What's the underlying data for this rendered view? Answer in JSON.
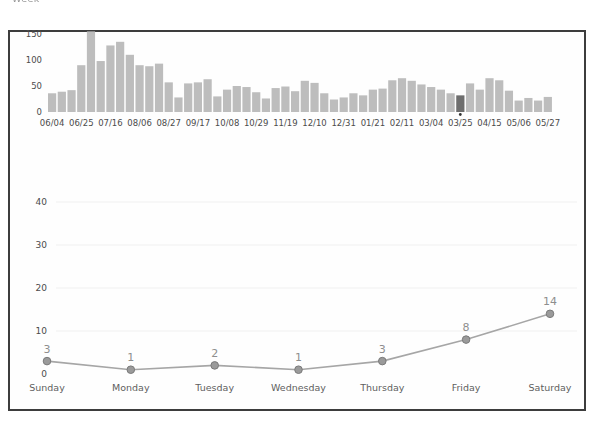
{
  "page": {
    "clipped_top_text": "Week",
    "colors": {
      "frame_border": "#3d3d3d",
      "frame_fill": "#fefefe",
      "background": "#ffffff"
    }
  },
  "chart_data": [
    {
      "type": "bar",
      "title": "",
      "description": "weekly-commit-activity",
      "x_tick_labels": [
        "06/04",
        "06/25",
        "07/16",
        "08/06",
        "08/27",
        "09/17",
        "10/08",
        "10/29",
        "11/19",
        "12/10",
        "12/31",
        "01/21",
        "02/11",
        "03/04",
        "03/25",
        "04/15",
        "05/06",
        "05/27"
      ],
      "x_tick_interval": 3,
      "values": [
        36,
        39,
        42,
        90,
        155,
        98,
        128,
        135,
        110,
        90,
        88,
        93,
        57,
        28,
        55,
        57,
        63,
        30,
        43,
        50,
        48,
        38,
        26,
        46,
        49,
        40,
        60,
        56,
        36,
        24,
        28,
        36,
        32,
        43,
        45,
        61,
        65,
        60,
        53,
        48,
        43,
        36,
        32,
        55,
        43,
        65,
        61,
        41,
        22,
        27,
        22,
        29
      ],
      "selected_index": 42,
      "selected_week_label": "03/25",
      "yticks": [
        0,
        50,
        100,
        150
      ],
      "ylim": [
        0,
        150
      ],
      "grid": false,
      "bar_color": "#bdbdbd",
      "selected_bar_color": "#6e6e6e",
      "caret_color": "#333333"
    },
    {
      "type": "line",
      "title": "",
      "description": "commits-by-day-of-week",
      "categories": [
        "Sunday",
        "Monday",
        "Tuesday",
        "Wednesday",
        "Thursday",
        "Friday",
        "Saturday"
      ],
      "values": [
        3,
        1,
        2,
        1,
        3,
        8,
        14
      ],
      "point_labels": [
        "3",
        "1",
        "2",
        "1",
        "3",
        "8",
        "14"
      ],
      "yticks": [
        0,
        10,
        20,
        30,
        40
      ],
      "ylim": [
        0,
        40
      ],
      "grid": true,
      "legend": "none",
      "line_color": "#a6a6a6",
      "marker_fill": "#9a9a9a",
      "marker_stroke": "#7a7a7a",
      "value_label_color": "#8e8e8e"
    }
  ]
}
